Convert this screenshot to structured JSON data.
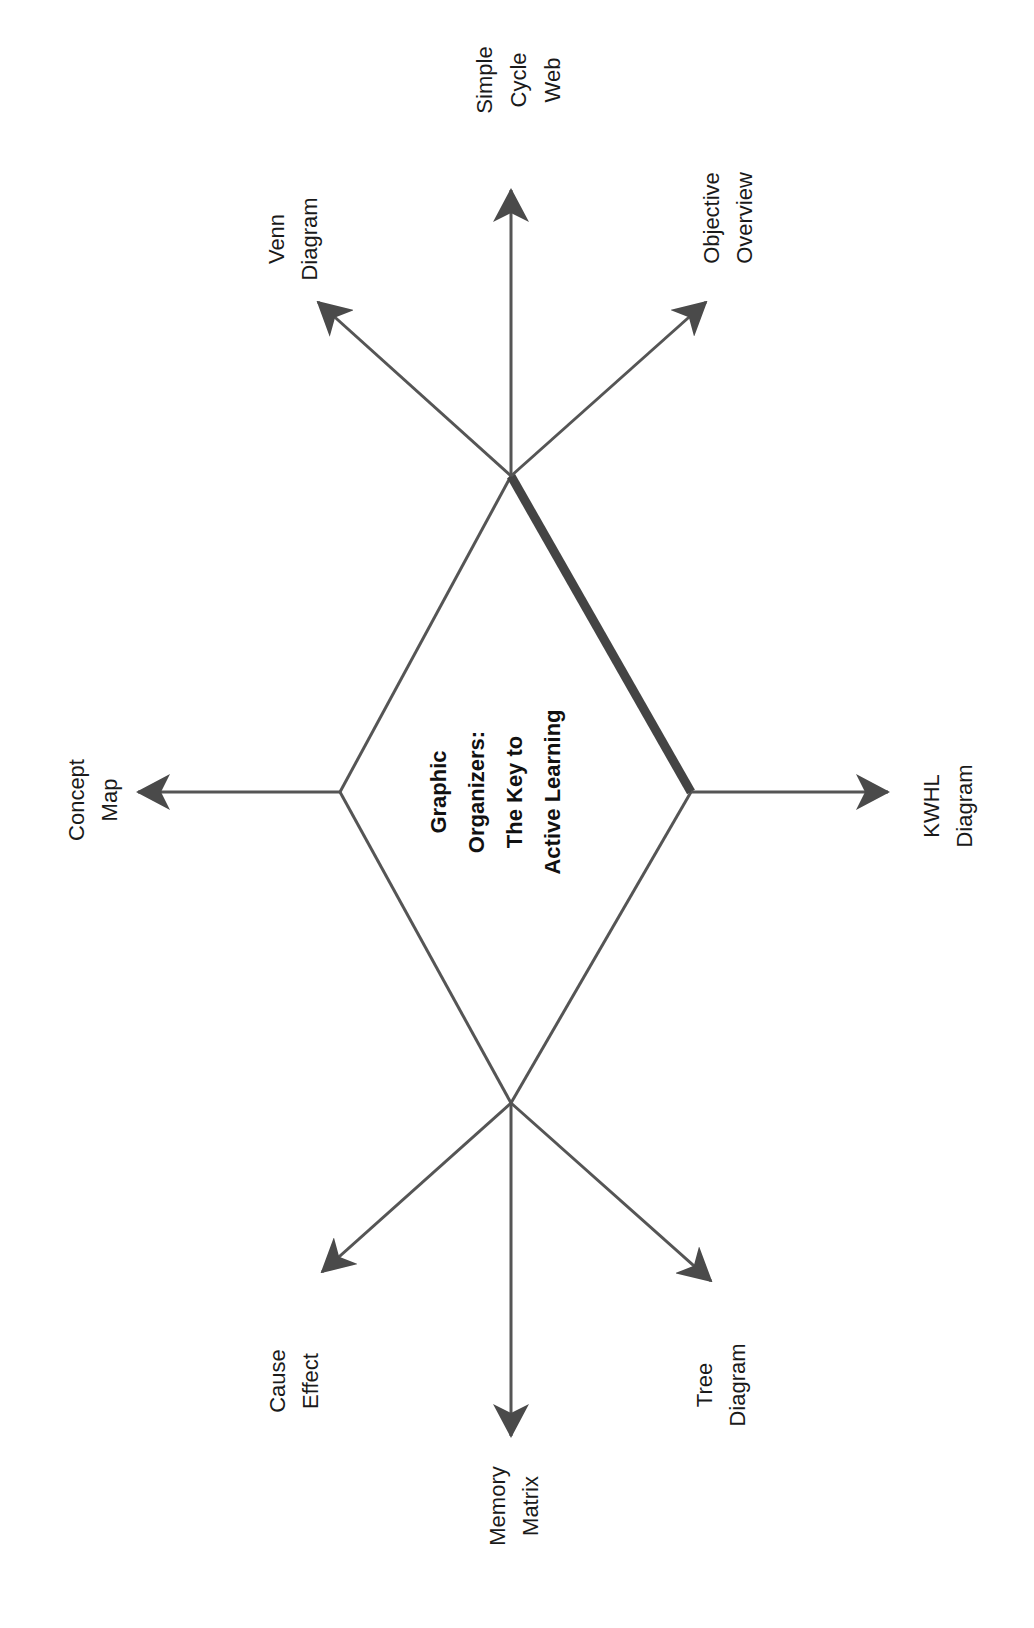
{
  "center": {
    "lines": [
      "Graphic",
      "Organizers:",
      "The Key to",
      "Active Learning"
    ]
  },
  "branches": [
    {
      "id": "simple-cycle-web",
      "lines": [
        "Simple",
        "Cycle",
        "Web"
      ]
    },
    {
      "id": "venn-diagram",
      "lines": [
        "Venn",
        "Diagram"
      ]
    },
    {
      "id": "objective-overview",
      "lines": [
        "Objective",
        "Overview"
      ]
    },
    {
      "id": "concept-map",
      "lines": [
        "Concept",
        "Map"
      ]
    },
    {
      "id": "kwhl-diagram",
      "lines": [
        "KWHL",
        "Diagram"
      ]
    },
    {
      "id": "cause-effect",
      "lines": [
        "Cause",
        "Effect"
      ]
    },
    {
      "id": "memory-matrix",
      "lines": [
        "Memory",
        "Matrix"
      ]
    },
    {
      "id": "tree-diagram",
      "lines": [
        "Tree",
        "Diagram"
      ]
    }
  ],
  "colors": {
    "line": "#555555",
    "arrowhead": "#4a4a4a",
    "text": "#1a1a1a",
    "background": "#ffffff"
  }
}
